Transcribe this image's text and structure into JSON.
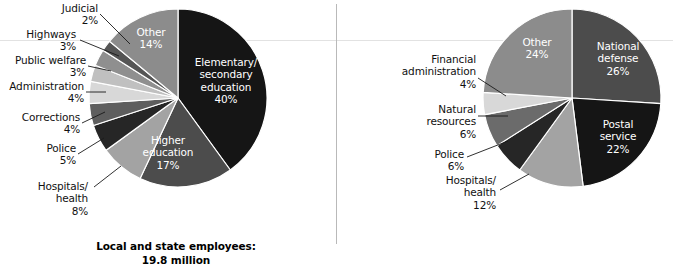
{
  "chart_data": [
    {
      "type": "pie",
      "title": "Local and state employees:",
      "subtitle": "19.8 million",
      "total_label": "19.8 million",
      "start_angle_deg": 0,
      "direction": "clockwise",
      "categories": [
        "Elementary/\nsecondary\neducation",
        "Higher\neducation",
        "Hospitals/\nhealth",
        "Police",
        "Corrections",
        "Administration",
        "Public welfare",
        "Highways",
        "Judicial",
        "Other"
      ],
      "labels_plain": [
        "Elementary/secondary education",
        "Higher education",
        "Hospitals/health",
        "Police",
        "Corrections",
        "Administration",
        "Public welfare",
        "Highways",
        "Judicial",
        "Other"
      ],
      "values": [
        40,
        17,
        8,
        5,
        4,
        4,
        3,
        3,
        2,
        14
      ],
      "value_labels": [
        "40%",
        "17%",
        "8%",
        "5%",
        "4%",
        "4%",
        "3%",
        "3%",
        "2%",
        "14%"
      ],
      "colors": [
        "#151515",
        "#4c4c4c",
        "#a3a3a3",
        "#262626",
        "#5e5e5e",
        "#d8d8d8",
        "#c0c0c0",
        "#8f8f8f",
        "#555555",
        "#8c8c8c"
      ],
      "legend": "none",
      "grid": false
    },
    {
      "type": "pie",
      "title": "Federal employees:",
      "subtitle": "2.9 million",
      "total_label": "2.9 million",
      "start_angle_deg": 0,
      "direction": "clockwise",
      "categories": [
        "National\ndefense",
        "Postal\nservice",
        "Hospitals/\nhealth",
        "Police",
        "Natural\nresources",
        "Financial\nadministration",
        "Other"
      ],
      "labels_plain": [
        "National defense",
        "Postal service",
        "Hospitals/health",
        "Police",
        "Natural resources",
        "Financial administration",
        "Other"
      ],
      "values": [
        26,
        22,
        12,
        6,
        6,
        4,
        24
      ],
      "value_labels": [
        "26%",
        "22%",
        "12%",
        "6%",
        "6%",
        "4%",
        "24%"
      ],
      "colors": [
        "#4c4c4c",
        "#151515",
        "#a3a3a3",
        "#262626",
        "#6b6b6b",
        "#d8d8d8",
        "#8c8c8c"
      ],
      "legend": "none",
      "grid": false
    }
  ],
  "left_chart": {
    "caption": "Local and state employees:\n19.8 million",
    "inner_labels": [
      {
        "text": "Elementary/\nsecondary\neducation\n40%"
      },
      {
        "text": "Higher\neducation\n17%"
      },
      {
        "text": "Other\n14%"
      }
    ],
    "outer_labels": [
      {
        "text": "Judicial\n2%"
      },
      {
        "text": "Highways\n3%"
      },
      {
        "text": "Public welfare\n3%"
      },
      {
        "text": "Administration\n4%"
      },
      {
        "text": "Corrections\n4%"
      },
      {
        "text": "Police\n5%"
      },
      {
        "text": "Hospitals/\nhealth\n8%"
      }
    ]
  },
  "right_chart": {
    "caption": "Federal employees:\n2.9 million",
    "inner_labels": [
      {
        "text": "National\ndefense\n26%"
      },
      {
        "text": "Postal\nservice\n22%"
      },
      {
        "text": "Other\n24%"
      }
    ],
    "outer_labels": [
      {
        "text": "Financial\nadministration\n4%"
      },
      {
        "text": "Natural\nresources\n6%"
      },
      {
        "text": "Police\n6%"
      },
      {
        "text": "Hospitals/\nhealth\n12%"
      }
    ]
  }
}
